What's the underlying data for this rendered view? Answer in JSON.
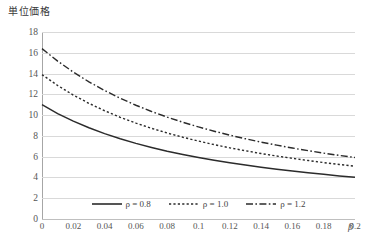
{
  "chart_data": {
    "type": "line",
    "title": "",
    "subtitle": "",
    "xlabel": "β",
    "ylabel": "単位価格",
    "xlim": [
      0,
      0.2
    ],
    "ylim": [
      0,
      18
    ],
    "grid": true,
    "legend_position": "bottom-center",
    "x_ticks": [
      "0",
      "0.02",
      "0.04",
      "0.06",
      "0.08",
      "0.1",
      "0.12",
      "0.14",
      "0.16",
      "0.18",
      "0.2"
    ],
    "x_tick_values": [
      0,
      0.02,
      0.04,
      0.06,
      0.08,
      0.1,
      0.12,
      0.14,
      0.16,
      0.18,
      0.2
    ],
    "y_ticks": [
      "0",
      "2",
      "4",
      "6",
      "8",
      "10",
      "12",
      "14",
      "16",
      "18"
    ],
    "y_tick_values": [
      0,
      2,
      4,
      6,
      8,
      10,
      12,
      14,
      16,
      18
    ],
    "x": [
      0,
      0.01,
      0.02,
      0.03,
      0.04,
      0.05,
      0.06,
      0.07,
      0.08,
      0.09,
      0.1,
      0.11,
      0.12,
      0.13,
      0.14,
      0.15,
      0.16,
      0.17,
      0.18,
      0.19,
      0.2
    ],
    "series": [
      {
        "name": "ρ = 0.8",
        "label_prefix": "ρ",
        "label_value": "0.8",
        "style": "solid",
        "color": "#2b2b2b",
        "values": [
          11.0,
          10.15,
          9.42,
          8.78,
          8.22,
          7.72,
          7.28,
          6.89,
          6.53,
          6.21,
          5.92,
          5.65,
          5.41,
          5.19,
          4.98,
          4.79,
          4.61,
          4.45,
          4.3,
          4.15,
          4.02
        ]
      },
      {
        "name": "ρ = 1.0",
        "label_prefix": "ρ",
        "label_value": "1.0",
        "style": "dotted",
        "color": "#2b2b2b",
        "values": [
          13.9,
          12.85,
          11.93,
          11.13,
          10.42,
          9.79,
          9.23,
          8.73,
          8.28,
          7.87,
          7.5,
          7.16,
          6.85,
          6.57,
          6.3,
          6.06,
          5.84,
          5.63,
          5.43,
          5.25,
          5.08
        ]
      },
      {
        "name": "ρ = 1.2",
        "label_prefix": "ρ",
        "label_value": "1.2",
        "style": "dash-dot",
        "color": "#2b2b2b",
        "values": [
          16.4,
          15.2,
          14.14,
          13.2,
          12.37,
          11.62,
          10.95,
          10.35,
          9.81,
          9.31,
          8.86,
          8.45,
          8.07,
          7.72,
          7.4,
          7.11,
          6.83,
          6.58,
          6.34,
          6.12,
          5.92
        ]
      }
    ]
  },
  "legend": {
    "entries": [
      {
        "text": "ρ = 0.8",
        "style": "solid"
      },
      {
        "text": "ρ = 1.0",
        "style": "dotted"
      },
      {
        "text": "ρ = 1.2",
        "style": "dash-dot"
      }
    ]
  },
  "axis": {
    "y_title": "単位価格",
    "x_title": "β"
  }
}
